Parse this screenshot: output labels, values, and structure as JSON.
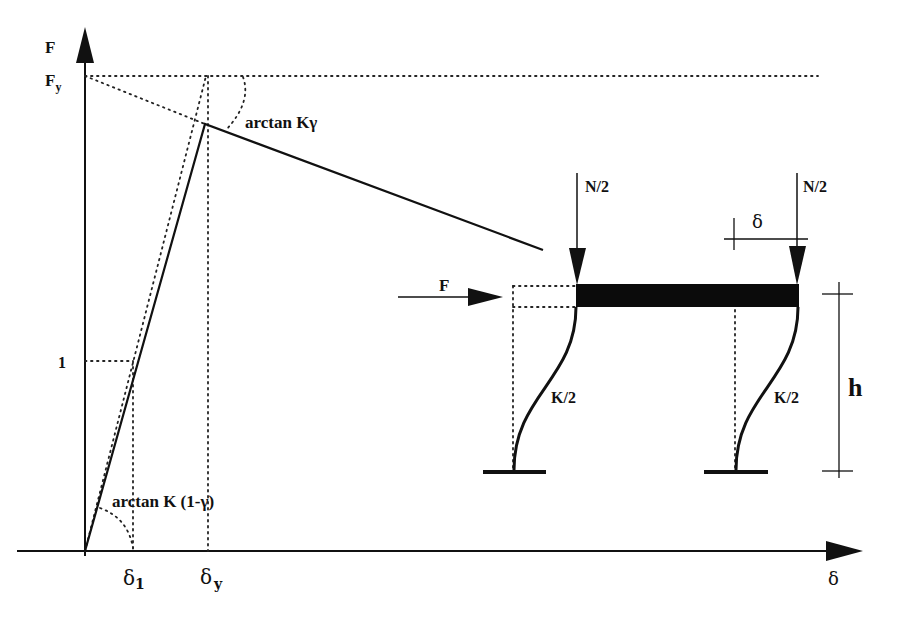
{
  "diagram": {
    "type": "force-displacement curve with portal frame schematic",
    "graph": {
      "y_axis_label": "F",
      "y_tick_fy": "F",
      "y_tick_fy_sub": "y",
      "y_tick_one": "1",
      "x_axis_label": "δ",
      "x_tick_delta1": "δ",
      "x_tick_delta1_sub": "1",
      "x_tick_deltay": "δ",
      "x_tick_deltay_sub": "y",
      "angle_label_post_yield": "arctan Kγ",
      "angle_label_initial": "arctan K (1-γ)"
    },
    "frame": {
      "lateral_force_label": "F",
      "axial_load_left": "N/2",
      "axial_load_right": "N/2",
      "drift_label": "δ",
      "column_stiffness_left": "K/2",
      "column_stiffness_right": "K/2",
      "height_label": "h"
    }
  }
}
